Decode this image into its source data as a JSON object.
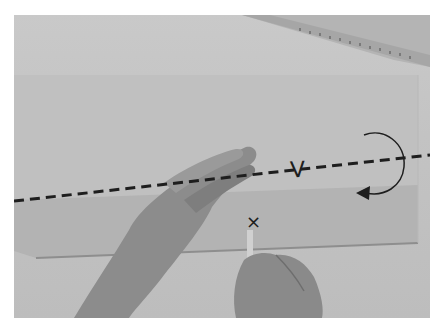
{
  "photo": {
    "description": "Grayscale instructional photo: hands folding a sheet of paper along a dashed valley-fold line, ruler in top-right corner, curved arrow indicating fold direction, pencil marking an X point",
    "annotations": {
      "fold_label": "V",
      "mark_label": "×"
    },
    "colors": {
      "background": "#ffffff",
      "table_surface": "#c6c6c6",
      "paper_shadow": "#a8a8a8",
      "line_ink": "#1e1e1e",
      "ruler": "#b0b0b0",
      "skin": "#8a8a8a"
    }
  }
}
